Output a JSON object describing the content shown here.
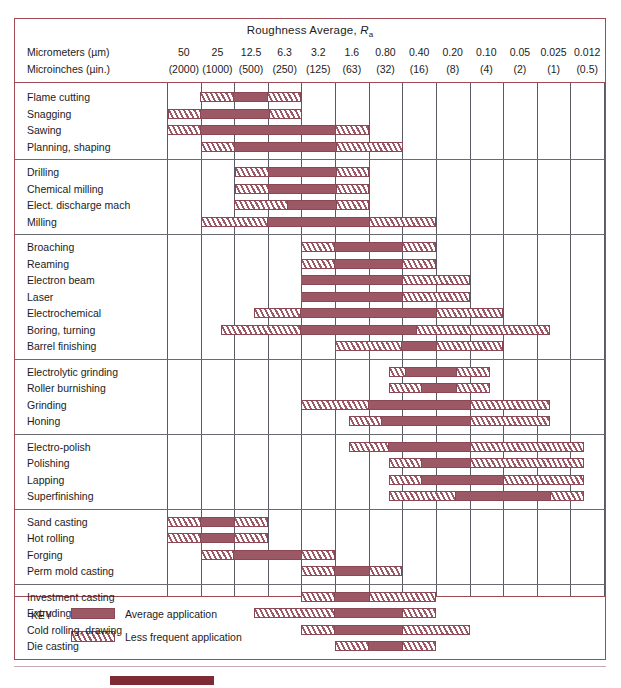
{
  "chart_data": {
    "type": "bar",
    "title": "Roughness Average, Ra",
    "title_prefix": "Roughness Average, ",
    "title_symbol": "R",
    "title_subscript": "a",
    "xlabel": "",
    "ylabel": "",
    "grid": true,
    "legend_position": "bottom-left",
    "axis_rows": [
      {
        "label": "Micrometers (µm)",
        "ticks": [
          "50",
          "25",
          "12.5",
          "6.3",
          "3.2",
          "1.6",
          "0.80",
          "0.40",
          "0.20",
          "0.10",
          "0.05",
          "0.025",
          "0.012"
        ]
      },
      {
        "label": "Microinches (µin.)",
        "ticks": [
          "(2000)",
          "(1000)",
          "(500)",
          "(250)",
          "(125)",
          "(63)",
          "(32)",
          "(16)",
          "(8)",
          "(4)",
          "(2)",
          "(1)",
          "(0.5)"
        ]
      }
    ],
    "column_count": 13,
    "legend": [
      {
        "key": "average",
        "label": "Average application",
        "style": "solid",
        "color": "#9d5865"
      },
      {
        "key": "less-frequent",
        "label": "Less frequent application",
        "style": "hatch",
        "color": "#9d5865"
      }
    ],
    "key_word": "KEY",
    "groups": [
      {
        "name": "group-1",
        "rows": [
          {
            "label": "Flame cutting",
            "segments": [
              {
                "style": "hatch",
                "start": 0.98,
                "end": 1.98
              },
              {
                "style": "solid",
                "start": 1.98,
                "end": 2.98
              },
              {
                "style": "hatch",
                "start": 2.98,
                "end": 3.98
              }
            ]
          },
          {
            "label": "Snagging",
            "segments": [
              {
                "style": "hatch",
                "start": 0.02,
                "end": 1.02
              },
              {
                "style": "solid",
                "start": 1.02,
                "end": 3.02
              },
              {
                "style": "hatch",
                "start": 3.02,
                "end": 4.02
              }
            ]
          },
          {
            "label": "Sawing",
            "segments": [
              {
                "style": "hatch",
                "start": 0.0,
                "end": 1.0
              },
              {
                "style": "solid",
                "start": 1.0,
                "end": 5.0
              },
              {
                "style": "hatch",
                "start": 5.0,
                "end": 6.0
              }
            ]
          },
          {
            "label": "Planning, shaping",
            "segments": [
              {
                "style": "hatch",
                "start": 1.02,
                "end": 2.02
              },
              {
                "style": "solid",
                "start": 2.02,
                "end": 5.02
              },
              {
                "style": "hatch",
                "start": 5.02,
                "end": 7.02
              }
            ]
          }
        ]
      },
      {
        "name": "group-2",
        "rows": [
          {
            "label": "Drilling",
            "segments": [
              {
                "style": "hatch",
                "start": 2.02,
                "end": 3.02
              },
              {
                "style": "solid",
                "start": 3.02,
                "end": 5.02
              },
              {
                "style": "hatch",
                "start": 5.02,
                "end": 6.02
              }
            ]
          },
          {
            "label": "Chemical milling",
            "segments": [
              {
                "style": "hatch",
                "start": 2.02,
                "end": 3.02
              },
              {
                "style": "solid",
                "start": 3.02,
                "end": 5.02
              },
              {
                "style": "hatch",
                "start": 5.02,
                "end": 6.02
              }
            ]
          },
          {
            "label": "Elect. discharge mach",
            "segments": [
              {
                "style": "hatch",
                "start": 2.0,
                "end": 3.6
              },
              {
                "style": "solid",
                "start": 3.6,
                "end": 5.02
              },
              {
                "style": "hatch",
                "start": 5.02,
                "end": 6.02
              }
            ]
          },
          {
            "label": "Milling",
            "segments": [
              {
                "style": "hatch",
                "start": 1.0,
                "end": 3.0
              },
              {
                "style": "solid",
                "start": 3.0,
                "end": 6.0
              },
              {
                "style": "hatch",
                "start": 6.0,
                "end": 8.0
              }
            ]
          }
        ]
      },
      {
        "name": "group-3",
        "rows": [
          {
            "label": "Broaching",
            "segments": [
              {
                "style": "hatch",
                "start": 4.0,
                "end": 5.0
              },
              {
                "style": "solid",
                "start": 5.0,
                "end": 7.0
              },
              {
                "style": "hatch",
                "start": 7.0,
                "end": 8.0
              }
            ]
          },
          {
            "label": "Reaming",
            "segments": [
              {
                "style": "hatch",
                "start": 4.0,
                "end": 5.0
              },
              {
                "style": "solid",
                "start": 5.0,
                "end": 7.0
              },
              {
                "style": "hatch",
                "start": 7.0,
                "end": 8.0
              }
            ]
          },
          {
            "label": "Electron beam",
            "segments": [
              {
                "style": "solid",
                "start": 4.0,
                "end": 7.0
              },
              {
                "style": "hatch",
                "start": 7.0,
                "end": 9.0
              }
            ]
          },
          {
            "label": "Laser",
            "segments": [
              {
                "style": "solid",
                "start": 4.0,
                "end": 7.0
              },
              {
                "style": "hatch",
                "start": 7.0,
                "end": 9.0
              }
            ]
          },
          {
            "label": "Electrochemical",
            "segments": [
              {
                "style": "hatch",
                "start": 2.6,
                "end": 4.0
              },
              {
                "style": "solid",
                "start": 4.0,
                "end": 8.0
              },
              {
                "style": "hatch",
                "start": 8.0,
                "end": 10.0
              }
            ]
          },
          {
            "label": "Boring, turning",
            "segments": [
              {
                "style": "hatch",
                "start": 1.6,
                "end": 4.0
              },
              {
                "style": "solid",
                "start": 4.0,
                "end": 7.4
              },
              {
                "style": "hatch",
                "start": 7.4,
                "end": 11.4
              }
            ]
          },
          {
            "label": "Barrel finishing",
            "segments": [
              {
                "style": "hatch",
                "start": 5.0,
                "end": 7.0
              },
              {
                "style": "solid",
                "start": 7.0,
                "end": 8.0
              },
              {
                "style": "hatch",
                "start": 8.0,
                "end": 10.0
              }
            ]
          }
        ]
      },
      {
        "name": "group-4",
        "rows": [
          {
            "label": "Electrolytic grinding",
            "segments": [
              {
                "style": "hatch",
                "start": 6.6,
                "end": 7.1
              },
              {
                "style": "solid",
                "start": 7.1,
                "end": 8.6
              },
              {
                "style": "hatch",
                "start": 8.6,
                "end": 9.6
              }
            ]
          },
          {
            "label": "Roller burnishing",
            "segments": [
              {
                "style": "hatch",
                "start": 6.6,
                "end": 7.6
              },
              {
                "style": "solid",
                "start": 7.6,
                "end": 8.6
              },
              {
                "style": "hatch",
                "start": 8.6,
                "end": 9.6
              }
            ]
          },
          {
            "label": "Grinding",
            "segments": [
              {
                "style": "hatch",
                "start": 4.0,
                "end": 6.0
              },
              {
                "style": "solid",
                "start": 6.0,
                "end": 9.0
              },
              {
                "style": "hatch",
                "start": 9.0,
                "end": 11.4
              }
            ]
          },
          {
            "label": "Honing",
            "segments": [
              {
                "style": "hatch",
                "start": 5.4,
                "end": 6.4
              },
              {
                "style": "solid",
                "start": 6.4,
                "end": 9.0
              },
              {
                "style": "hatch",
                "start": 9.0,
                "end": 11.4
              }
            ]
          }
        ]
      },
      {
        "name": "group-5",
        "rows": [
          {
            "label": "Electro-polish",
            "segments": [
              {
                "style": "hatch",
                "start": 5.4,
                "end": 6.6
              },
              {
                "style": "solid",
                "start": 6.6,
                "end": 9.0
              },
              {
                "style": "hatch",
                "start": 9.0,
                "end": 12.4
              }
            ]
          },
          {
            "label": "Polishing",
            "segments": [
              {
                "style": "hatch",
                "start": 6.6,
                "end": 7.6
              },
              {
                "style": "solid",
                "start": 7.6,
                "end": 9.0
              },
              {
                "style": "hatch",
                "start": 9.0,
                "end": 12.4
              }
            ]
          },
          {
            "label": "Lapping",
            "segments": [
              {
                "style": "hatch",
                "start": 6.6,
                "end": 7.6
              },
              {
                "style": "solid",
                "start": 7.6,
                "end": 10.0
              },
              {
                "style": "hatch",
                "start": 10.0,
                "end": 12.4
              }
            ]
          },
          {
            "label": "Superfinishing",
            "segments": [
              {
                "style": "hatch",
                "start": 6.6,
                "end": 8.6
              },
              {
                "style": "solid",
                "start": 8.6,
                "end": 11.4
              },
              {
                "style": "hatch",
                "start": 11.4,
                "end": 12.4
              }
            ]
          }
        ]
      },
      {
        "name": "group-6",
        "rows": [
          {
            "label": "Sand casting",
            "segments": [
              {
                "style": "hatch",
                "start": 0.0,
                "end": 1.0
              },
              {
                "style": "solid",
                "start": 1.0,
                "end": 2.0
              },
              {
                "style": "hatch",
                "start": 2.0,
                "end": 3.0
              }
            ]
          },
          {
            "label": "Hot rolling",
            "segments": [
              {
                "style": "hatch",
                "start": 0.0,
                "end": 1.0
              },
              {
                "style": "solid",
                "start": 1.0,
                "end": 2.0
              },
              {
                "style": "hatch",
                "start": 2.0,
                "end": 3.0
              }
            ]
          },
          {
            "label": "Forging",
            "segments": [
              {
                "style": "hatch",
                "start": 1.0,
                "end": 2.0
              },
              {
                "style": "solid",
                "start": 2.0,
                "end": 4.0
              },
              {
                "style": "hatch",
                "start": 4.0,
                "end": 5.0
              }
            ]
          },
          {
            "label": "Perm mold casting",
            "segments": [
              {
                "style": "hatch",
                "start": 4.0,
                "end": 5.0
              },
              {
                "style": "solid",
                "start": 5.0,
                "end": 6.0
              },
              {
                "style": "hatch",
                "start": 6.0,
                "end": 7.0
              }
            ]
          }
        ]
      },
      {
        "name": "group-7",
        "rows": [
          {
            "label": "Investment casting",
            "segments": [
              {
                "style": "hatch",
                "start": 4.0,
                "end": 5.0
              },
              {
                "style": "solid",
                "start": 5.0,
                "end": 6.0
              },
              {
                "style": "hatch",
                "start": 6.0,
                "end": 8.0
              }
            ]
          },
          {
            "label": "Extruding",
            "segments": [
              {
                "style": "hatch",
                "start": 2.6,
                "end": 5.0
              },
              {
                "style": "solid",
                "start": 5.0,
                "end": 7.0
              },
              {
                "style": "hatch",
                "start": 7.0,
                "end": 8.0
              }
            ]
          },
          {
            "label": "Cold rolling, drawing",
            "segments": [
              {
                "style": "hatch",
                "start": 4.0,
                "end": 5.0
              },
              {
                "style": "solid",
                "start": 5.0,
                "end": 7.0
              },
              {
                "style": "hatch",
                "start": 7.0,
                "end": 9.0
              }
            ]
          },
          {
            "label": "Die casting",
            "segments": [
              {
                "style": "hatch",
                "start": 5.0,
                "end": 6.0
              },
              {
                "style": "solid",
                "start": 6.0,
                "end": 7.0
              },
              {
                "style": "hatch",
                "start": 7.0,
                "end": 8.0
              }
            ]
          }
        ]
      }
    ]
  }
}
